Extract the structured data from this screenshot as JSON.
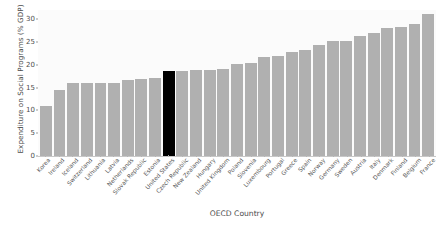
{
  "chart_data": {
    "type": "bar",
    "title": "",
    "xlabel": "OECD Country",
    "ylabel": "Expenditure on Social Programs (% GDP)",
    "ylim": [
      0,
      32
    ],
    "yticks": [
      0,
      5,
      10,
      15,
      20,
      25,
      30
    ],
    "grid": false,
    "legend": null,
    "highlight_category": "United States",
    "highlight_color": "#000000",
    "bar_color": "#b0b0b0",
    "categories": [
      "Korea",
      "Ireland",
      "Iceland",
      "Switzerland",
      "Lithuania",
      "Latvia",
      "Netherlands",
      "Slovak Republic",
      "Estonia",
      "United States",
      "Czech Republic",
      "New Zealand",
      "Hungary",
      "United Kingdom",
      "Poland",
      "Slovenia",
      "Luxembourg",
      "Portugal",
      "Greece",
      "Spain",
      "Norway",
      "Germany",
      "Sweden",
      "Austria",
      "Italy",
      "Denmark",
      "Finland",
      "Belgium",
      "France"
    ],
    "values": [
      10.9,
      14.4,
      15.9,
      15.9,
      16.1,
      16.1,
      16.6,
      16.8,
      17.1,
      18.7,
      18.7,
      18.8,
      18.9,
      19.0,
      20.2,
      20.4,
      21.6,
      22.0,
      22.7,
      23.3,
      24.3,
      25.1,
      25.3,
      26.2,
      26.9,
      28.0,
      28.3,
      28.9,
      31.2
    ]
  }
}
